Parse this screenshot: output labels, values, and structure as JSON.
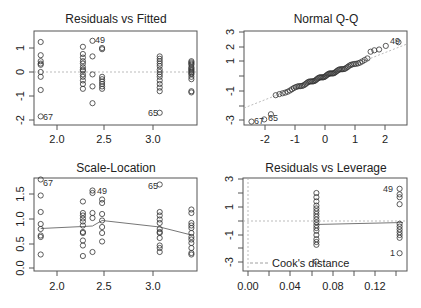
{
  "chart_data": [
    {
      "type": "scatter",
      "title": "Residuals vs Fitted",
      "xlabel": "",
      "ylabel": "",
      "xlim": [
        1.76,
        3.45
      ],
      "ylim": [
        -2.2,
        1.7
      ],
      "xticks": [
        "2.0",
        "2.5",
        "3.0"
      ],
      "yticks": [
        "-2",
        "-1",
        "0",
        "1"
      ],
      "reference_line": {
        "y": 0,
        "style": "dotted"
      },
      "groups": [
        {
          "x": 1.83,
          "y": [
            1.25,
            0.7,
            0.45,
            0.35,
            0.3,
            0.0,
            -0.2,
            -0.75,
            -1.85
          ]
        },
        {
          "x": 2.27,
          "y": [
            1.05,
            0.75,
            0.6,
            0.45,
            0.35,
            0.2,
            0.1,
            0.05,
            -0.1,
            -0.2,
            -0.35,
            -0.5,
            -0.7
          ]
        },
        {
          "x": 2.37,
          "y": [
            1.3,
            0.65,
            -0.1,
            -0.6,
            -1.3
          ]
        },
        {
          "x": 2.47,
          "y": [
            1.0,
            0.95,
            -0.2,
            -0.3,
            -0.4,
            -0.5,
            -0.6,
            -0.7
          ]
        },
        {
          "x": 3.07,
          "y": [
            0.65,
            0.55,
            0.45,
            0.35,
            0.25,
            0.1,
            0.0,
            -0.1,
            -0.2,
            -0.35,
            -0.5,
            -0.65,
            -0.8,
            -1.7
          ]
        },
        {
          "x": 3.4,
          "y": [
            0.45,
            0.4,
            0.35,
            0.3,
            0.2,
            0.15,
            0.1,
            0.05,
            0.0,
            -0.05,
            -0.1,
            -0.2,
            -0.3,
            -0.8,
            -0.85
          ]
        }
      ],
      "annotations": [
        {
          "label": "49",
          "x": 2.37,
          "y": 1.3
        },
        {
          "label": "67",
          "x": 1.83,
          "y": -1.85
        },
        {
          "label": "65",
          "x": 3.07,
          "y": -1.7
        }
      ]
    },
    {
      "type": "scatter",
      "title": "Normal Q-Q",
      "xlabel": "",
      "ylabel": "",
      "xlim": [
        -2.65,
        2.75
      ],
      "ylim": [
        -3.2,
        3.0
      ],
      "xticks": [
        "-2",
        "-1",
        "0",
        "1",
        "2"
      ],
      "yticks": [
        "-3",
        "-1",
        "1",
        "2",
        "3"
      ],
      "reference_line": {
        "from": [
          -2.65,
          -2.2
        ],
        "to": [
          2.75,
          2.15
        ],
        "style": "dotted"
      },
      "points_summary": "approx. 70 points following the line from (-2.5,-3.1) to (2.5,2.3)",
      "annotations": [
        {
          "label": "49",
          "x": 2.5,
          "y": 2.3
        },
        {
          "label": "67",
          "x": -2.5,
          "y": -3.1
        },
        {
          "label": "65",
          "x": -2.1,
          "y": -2.9
        }
      ]
    },
    {
      "type": "scatter",
      "title": "Scale-Location",
      "xlabel": "",
      "ylabel": "",
      "xlim": [
        1.76,
        3.45
      ],
      "ylim": [
        -0.05,
        1.85
      ],
      "xticks": [
        "2.0",
        "2.5",
        "3.0"
      ],
      "yticks": [
        "0.0",
        "0.5",
        "1.0",
        "1.5"
      ],
      "smooth_line": {
        "x": [
          1.83,
          2.27,
          2.37,
          2.47,
          3.07,
          3.4
        ],
        "y": [
          0.79,
          0.83,
          0.84,
          0.95,
          0.82,
          0.66
        ]
      },
      "groups": [
        {
          "x": 1.83,
          "y": [
            1.77,
            1.45,
            1.12,
            0.88,
            0.78,
            0.65,
            0.62,
            0.27
          ]
        },
        {
          "x": 2.27,
          "y": [
            1.33,
            1.1,
            1.05,
            0.99,
            0.93,
            0.85,
            0.72,
            0.7,
            0.55,
            0.45,
            0.24
          ]
        },
        {
          "x": 2.37,
          "y": [
            1.55,
            1.5,
            1.1,
            1.0,
            0.32
          ]
        },
        {
          "x": 2.47,
          "y": [
            1.37,
            1.3,
            1.08,
            0.95,
            0.82,
            0.7,
            0.53
          ]
        },
        {
          "x": 3.07,
          "y": [
            1.67,
            1.12,
            1.05,
            0.97,
            0.9,
            0.78,
            0.72,
            0.7,
            0.6,
            0.45,
            0.4,
            0.32
          ]
        },
        {
          "x": 3.4,
          "y": [
            1.17,
            1.1,
            0.9,
            0.85,
            0.8,
            0.7,
            0.62,
            0.57,
            0.5,
            0.4,
            0.3,
            0.27
          ]
        }
      ],
      "annotations": [
        {
          "label": "67",
          "x": 1.83,
          "y": 1.77
        },
        {
          "label": "49",
          "x": 2.37,
          "y": 1.55
        },
        {
          "label": "65",
          "x": 3.07,
          "y": 1.67
        }
      ]
    },
    {
      "type": "scatter",
      "title": "Residuals vs Leverage",
      "xlabel": "",
      "ylabel": "",
      "xlim": [
        -0.005,
        0.148
      ],
      "ylim": [
        -3.5,
        3.1
      ],
      "xticks": [
        "0.00",
        "0.04",
        "0.08",
        "0.12"
      ],
      "yticks": [
        "-3",
        "-1",
        "1",
        "3"
      ],
      "reference_line": {
        "y": 0,
        "style": "dotted"
      },
      "smooth_line": {
        "x": [
          0.0645,
          0.143
        ],
        "y": [
          -0.25,
          -0.1
        ]
      },
      "legend": {
        "position": "bottomleft",
        "entries": [
          "Cook's distance"
        ]
      },
      "groups": [
        {
          "x": 0.0645,
          "y": [
            2.0,
            1.7,
            1.4,
            1.1,
            0.9,
            0.7,
            0.5,
            0.3,
            0.1,
            -0.1,
            -0.3,
            -0.5,
            -0.7,
            -1.0,
            -1.3,
            -1.5,
            -1.7,
            -2.9
          ]
        },
        {
          "x": 0.143,
          "y": [
            2.3,
            1.9,
            1.7,
            1.2,
            -0.2,
            -0.4,
            -0.6,
            -0.8,
            -1.0,
            -1.2,
            -2.3
          ]
        }
      ],
      "annotations": [
        {
          "label": "49",
          "x": 0.143,
          "y": 2.3
        },
        {
          "label": "1",
          "x": 0.143,
          "y": -2.3
        },
        {
          "label": "67",
          "x": 0.0645,
          "y": -2.9
        }
      ]
    }
  ],
  "panels": {
    "p1": {
      "title": "Residuals vs Fitted",
      "xt": [
        "2.0",
        "2.5",
        "3.0"
      ],
      "yt": [
        "-2",
        "-1",
        "0",
        "1"
      ],
      "lab49": "49",
      "lab67": "67",
      "lab65": "65"
    },
    "p2": {
      "title": "Normal Q-Q",
      "xt": [
        "-2",
        "-1",
        "0",
        "1",
        "2"
      ],
      "yt": [
        "-3",
        "-1",
        "1",
        "2",
        "3"
      ],
      "lab49": "49",
      "lab67": "67",
      "lab65": "65"
    },
    "p3": {
      "title": "Scale-Location",
      "xt": [
        "2.0",
        "2.5",
        "3.0"
      ],
      "yt": [
        "0.0",
        "0.5",
        "1.0",
        "1.5"
      ],
      "lab49": "49",
      "lab67": "67",
      "lab65": "65"
    },
    "p4": {
      "title": "Residuals vs Leverage",
      "xt": [
        "0.00",
        "0.04",
        "0.08",
        "0.12"
      ],
      "yt": [
        "-3",
        "-1",
        "1",
        "3"
      ],
      "lab49": "49",
      "lab1": "1",
      "legend": "Cook's distance"
    }
  }
}
